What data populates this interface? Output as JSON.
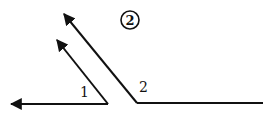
{
  "figure": {
    "title_circled": "2",
    "angles": [
      {
        "name": "angle-1",
        "label": "1",
        "ray_style": "both rays end in arrowheads"
      },
      {
        "name": "angle-2",
        "label": "2",
        "ray_style": "one ray ends in arrowhead, other is plain segment"
      }
    ],
    "colors": {
      "stroke": "#111111",
      "background": "#ffffff"
    }
  }
}
